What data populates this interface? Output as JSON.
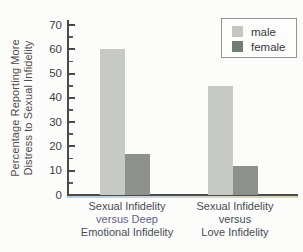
{
  "chart_data": {
    "type": "bar",
    "title": "",
    "ylabel_lines": [
      "Percentage Reporting More",
      "Distress to Sexual Infidelity"
    ],
    "ylabel": "Percentage Reporting More Distress to Sexual Infidelity",
    "xlabel": "",
    "ylim": [
      0,
      70
    ],
    "yticks": [
      0,
      10,
      20,
      30,
      40,
      50,
      60,
      70
    ],
    "minor_yticks": [
      5,
      15,
      25,
      35,
      45,
      55,
      65
    ],
    "grid": false,
    "legend_position": "top-right",
    "categories": [
      {
        "label": "Sexual Infidelity versus Deep Emotional Infidelity",
        "lines": [
          "Sexual Infidelity",
          "versus Deep",
          "Emotional Infidelity"
        ]
      },
      {
        "label": "Sexual Infidelity versus Love Infidelity",
        "lines": [
          "Sexual Infidelity",
          "versus",
          "Love Infidelity"
        ]
      }
    ],
    "series": [
      {
        "name": "male",
        "values": [
          60,
          45
        ],
        "color": "#c7c9c5"
      },
      {
        "name": "female",
        "values": [
          17,
          12
        ],
        "color": "#8c918d"
      }
    ]
  },
  "legend": {
    "items": [
      {
        "label": "male",
        "color": "#c3c7c2"
      },
      {
        "label": "female",
        "color": "#717d75"
      }
    ]
  },
  "colors": {
    "axis": "#4a4a4a",
    "tick_text": "#3d4145",
    "category_text": "#474c54",
    "ylabel_text": "#514b4d",
    "background": "#fcfcfa"
  }
}
